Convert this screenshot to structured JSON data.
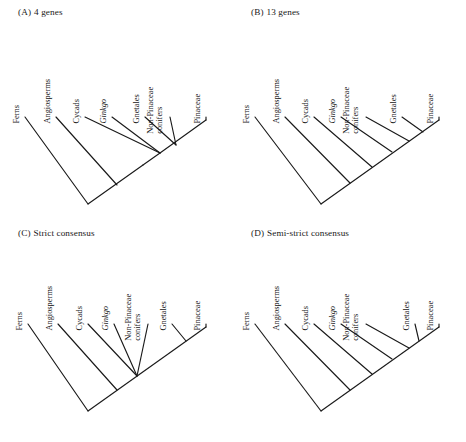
{
  "figure": {
    "background_color": "#ffffff",
    "line_color": "#1a1a1a",
    "panel_count": 4
  },
  "panels": [
    {
      "id": "A",
      "number": "(A)",
      "title": "4 genes",
      "tips": [
        {
          "name": "Ferns",
          "italic": false,
          "lines": [
            "Ferns"
          ]
        },
        {
          "name": "Angiosperms",
          "italic": false,
          "lines": [
            "Angiosperms"
          ]
        },
        {
          "name": "Cycads",
          "italic": false,
          "lines": [
            "Cycads"
          ]
        },
        {
          "name": "Ginkgo",
          "italic": true,
          "lines": [
            "Ginkgo"
          ]
        },
        {
          "name": "Gnetales",
          "italic": false,
          "lines": [
            "Gnetales"
          ]
        },
        {
          "name": "Non-Pinaceae conifers",
          "italic": false,
          "lines": [
            "Non-Pinaceae",
            "conifers"
          ]
        },
        {
          "name": "Pinaceae",
          "italic": false,
          "lines": [
            "Pinaceae"
          ]
        }
      ],
      "topology": "Ferns,(Angiosperms,(Cycads,Ginkgo,((Gnetales,Non-Pinaceae conifers),Pinaceae)))",
      "has_polytomy": true
    },
    {
      "id": "B",
      "number": "(B)",
      "title": "13 genes",
      "tips": [
        {
          "name": "Ferns",
          "italic": false,
          "lines": [
            "Ferns"
          ]
        },
        {
          "name": "Angiosperms",
          "italic": false,
          "lines": [
            "Angiosperms"
          ]
        },
        {
          "name": "Cycads",
          "italic": false,
          "lines": [
            "Cycads"
          ]
        },
        {
          "name": "Ginkgo",
          "italic": true,
          "lines": [
            "Ginkgo"
          ]
        },
        {
          "name": "Non-Pinaceae conifers",
          "italic": false,
          "lines": [
            "Non-Pinaceae",
            "conifers"
          ]
        },
        {
          "name": "Gnetales",
          "italic": false,
          "lines": [
            "Gnetales"
          ]
        },
        {
          "name": "Pinaceae",
          "italic": false,
          "lines": [
            "Pinaceae"
          ]
        }
      ],
      "topology": "Ferns,(Angiosperms,(Cycads,(Ginkgo,(Non-Pinaceae conifers,(Gnetales,Pinaceae)))))",
      "has_polytomy": false
    },
    {
      "id": "C",
      "number": "(C)",
      "title": "Strict consensus",
      "tips": [
        {
          "name": "Ferns",
          "italic": false,
          "lines": [
            "Ferns"
          ]
        },
        {
          "name": "Angiosperms",
          "italic": false,
          "lines": [
            "Angiosperms"
          ]
        },
        {
          "name": "Cycads",
          "italic": false,
          "lines": [
            "Cycads"
          ]
        },
        {
          "name": "Ginkgo",
          "italic": true,
          "lines": [
            "Ginkgo"
          ]
        },
        {
          "name": "Non-Pinaceae conifers",
          "italic": false,
          "lines": [
            "Non-Pinaceae",
            "conifers"
          ]
        },
        {
          "name": "Gnetales",
          "italic": false,
          "lines": [
            "Gnetales"
          ]
        },
        {
          "name": "Pinaceae",
          "italic": false,
          "lines": [
            "Pinaceae"
          ]
        }
      ],
      "topology": "Ferns,(Angiosperms,(Cycads,Ginkgo,Non-Pinaceae conifers,(Gnetales,Pinaceae)))",
      "has_polytomy": true
    },
    {
      "id": "D",
      "number": "(D)",
      "title": "Semi-strict consensus",
      "tips": [
        {
          "name": "Ferns",
          "italic": false,
          "lines": [
            "Ferns"
          ]
        },
        {
          "name": "Angiosperms",
          "italic": false,
          "lines": [
            "Angiosperms"
          ]
        },
        {
          "name": "Cycads",
          "italic": false,
          "lines": [
            "Cycads"
          ]
        },
        {
          "name": "Ginkgo",
          "italic": true,
          "lines": [
            "Ginkgo"
          ]
        },
        {
          "name": "Non-Pinaceae conifers",
          "italic": false,
          "lines": [
            "Non-Pinaceae",
            "conifers"
          ]
        },
        {
          "name": "Gnetales",
          "italic": false,
          "lines": [
            "Gnetales"
          ]
        },
        {
          "name": "Pinaceae",
          "italic": false,
          "lines": [
            "Pinaceae"
          ]
        }
      ],
      "topology": "Ferns,(Angiosperms,(Cycads,(Ginkgo,(Non-Pinaceae conifers,(Gnetales,Pinaceae)))))",
      "has_polytomy": true
    }
  ]
}
